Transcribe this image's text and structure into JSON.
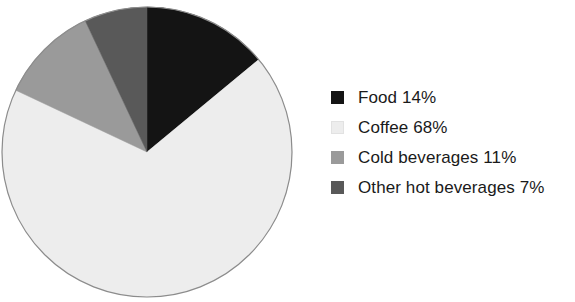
{
  "chart_data": {
    "type": "pie",
    "title": "",
    "subtitle": "",
    "xlabel": "",
    "ylabel": "",
    "legend_position": "right",
    "grid": false,
    "start_angle_deg": 0,
    "direction": "clockwise",
    "units": "percent",
    "categories": [
      "Food",
      "Coffee",
      "Cold beverages",
      "Other hot beverages"
    ],
    "values": [
      14,
      68,
      11,
      7
    ],
    "value_labels": [
      "14%",
      "68%",
      "11%",
      "7%"
    ],
    "legend_entries": [
      "Food 14%",
      "Coffee 68%",
      "Cold beverages 11%",
      "Other hot beverages 7%"
    ],
    "slices": [
      {
        "label": "Food",
        "value": 14,
        "value_label": "14%",
        "legend_text": "Food 14%",
        "color": "#141414",
        "start_angle_deg": 0,
        "end_angle_deg": 50.4
      },
      {
        "label": "Coffee",
        "value": 68,
        "value_label": "68%",
        "legend_text": "Coffee 68%",
        "color": "#ededed",
        "start_angle_deg": 50.4,
        "end_angle_deg": 295.2
      },
      {
        "label": "Cold beverages",
        "value": 11,
        "value_label": "11%",
        "legend_text": "Cold beverages 11%",
        "color": "#9a9a9a",
        "start_angle_deg": 295.2,
        "end_angle_deg": 334.8
      },
      {
        "label": "Other hot beverages",
        "value": 7,
        "value_label": "7%",
        "legend_text": "Other hot beverages 7%",
        "color": "#595959",
        "start_angle_deg": 334.8,
        "end_angle_deg": 360
      }
    ],
    "colors": [
      "#141414",
      "#ededed",
      "#9a9a9a",
      "#595959"
    ],
    "outline_color": "#8c8c8c",
    "background_color": "#ffffff",
    "geometry": {
      "center_x": 147,
      "center_y": 148,
      "radius": 145
    }
  }
}
